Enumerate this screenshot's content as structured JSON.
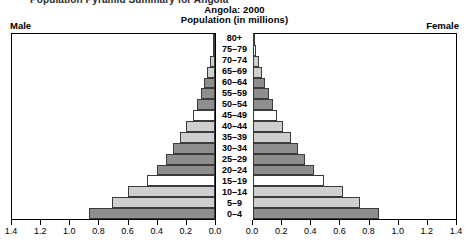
{
  "page_title": "Population Pyramid Summary for Angola",
  "header": {
    "title": "Angola: 2000",
    "subtitle": "Population (in millions)",
    "male_label": "Male",
    "female_label": "Female"
  },
  "colors": {
    "bar_dark": "#8e8e8e",
    "bar_light": "#cfcfcf",
    "bar_white": "#ffffff",
    "bar_outline": "#3b3b3b",
    "frame": "#000000"
  },
  "chart_data": {
    "type": "bar",
    "subtype": "population-pyramid",
    "title": "Angola: 2000",
    "subtitle": "Population (in millions)",
    "xlabel": "Population (in millions)",
    "ylabel": "",
    "xlim": [
      0.0,
      1.4
    ],
    "grid": false,
    "legend": "none",
    "axis_orientation": "horizontal-mirrored",
    "left_axis_direction": "reversed",
    "xticks": [
      0.0,
      0.2,
      0.4,
      0.6,
      0.8,
      1.0,
      1.2,
      1.4
    ],
    "xtick_labels_left": [
      "1.4",
      "1.2",
      "1.0",
      "0.8",
      "0.6",
      "0.4",
      "0.2",
      "0.0"
    ],
    "xtick_labels_right": [
      "0.0",
      "0.2",
      "0.4",
      "0.6",
      "0.8",
      "1.0",
      "1.2",
      "1.4"
    ],
    "categories": [
      "80+",
      "75-79",
      "70-74",
      "65-69",
      "60-64",
      "55-59",
      "50-54",
      "45-49",
      "40-44",
      "35-39",
      "30-34",
      "25-29",
      "20-24",
      "15-19",
      "10-14",
      "5-9",
      "0-4"
    ],
    "series": [
      {
        "name": "Male",
        "side": "left",
        "values": [
          0.008,
          0.016,
          0.032,
          0.053,
          0.077,
          0.1,
          0.125,
          0.155,
          0.2,
          0.24,
          0.29,
          0.34,
          0.4,
          0.47,
          0.6,
          0.71,
          0.87
        ]
      },
      {
        "name": "Female",
        "side": "right",
        "values": [
          0.011,
          0.02,
          0.038,
          0.06,
          0.085,
          0.11,
          0.135,
          0.165,
          0.21,
          0.26,
          0.31,
          0.36,
          0.42,
          0.49,
          0.62,
          0.74,
          0.87
        ]
      }
    ],
    "bar_shades": [
      "dark",
      "white",
      "light",
      "light",
      "dark",
      "dark",
      "dark",
      "white",
      "light",
      "light",
      "dark",
      "dark",
      "dark",
      "white",
      "light",
      "light",
      "dark"
    ]
  }
}
